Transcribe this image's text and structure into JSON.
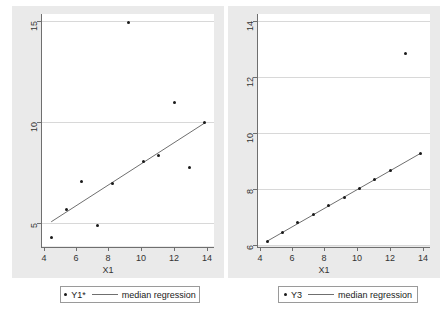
{
  "figure": {
    "background_color": "#ffffff",
    "panel_background": "#eaeaea",
    "plot_background": "#ffffff",
    "grid_color": "#d8d8d8",
    "axis_color": "#6f6f6f",
    "marker_color": "#1a1a1a",
    "line_color": "#6f6f6f"
  },
  "chart_data": [
    {
      "type": "scatter",
      "panel": "left",
      "title": "",
      "xlabel": "X1",
      "ylabel": "",
      "xlim": [
        3.4,
        14.6
      ],
      "ylim": [
        3.9,
        15.4
      ],
      "xticks": [
        4,
        6,
        8,
        10,
        12,
        14
      ],
      "yticks": [
        5,
        10,
        15
      ],
      "grid": true,
      "legend_position": "below",
      "series": [
        {
          "name": "Y1*",
          "type": "scatter",
          "x": [
            4,
            5,
            6,
            7,
            8,
            9,
            10,
            11,
            12,
            13,
            14
          ],
          "y": [
            4.3,
            5.7,
            7.1,
            4.9,
            7.0,
            15.0,
            8.1,
            8.4,
            11.0,
            7.8,
            10.0
          ]
        },
        {
          "name": "median regression",
          "type": "line",
          "x": [
            4,
            14
          ],
          "y": [
            5.1,
            10.0
          ]
        }
      ]
    },
    {
      "type": "scatter",
      "panel": "right",
      "title": "",
      "xlabel": "X1",
      "ylabel": "",
      "xlim": [
        3.4,
        14.6
      ],
      "ylim": [
        5.2,
        14.3
      ],
      "xticks": [
        4,
        6,
        8,
        10,
        12,
        14
      ],
      "yticks": [
        6,
        8,
        10,
        12,
        14
      ],
      "grid": true,
      "legend_position": "below",
      "series": [
        {
          "name": "Y3",
          "type": "scatter",
          "x": [
            4,
            5,
            6,
            7,
            8,
            9,
            10,
            11,
            12,
            13,
            14
          ],
          "y": [
            5.39,
            5.73,
            6.11,
            6.42,
            6.77,
            7.11,
            7.46,
            7.81,
            8.15,
            12.74,
            8.84
          ]
        },
        {
          "name": "median regression",
          "type": "line",
          "x": [
            4,
            14
          ],
          "y": [
            5.39,
            8.84
          ]
        }
      ]
    }
  ],
  "left_panel": {
    "xaxis_title": "X1",
    "xticklabels": [
      "4",
      "6",
      "8",
      "10",
      "12",
      "14"
    ],
    "yticklabels": [
      "5",
      "10",
      "15"
    ],
    "legend": {
      "marker_label": "Y1*",
      "line_label": "median regression"
    }
  },
  "right_panel": {
    "xaxis_title": "X1",
    "xticklabels": [
      "4",
      "6",
      "8",
      "10",
      "12",
      "14"
    ],
    "yticklabels": [
      "6",
      "8",
      "10",
      "12",
      "14"
    ],
    "legend": {
      "marker_label": "Y3",
      "line_label": "median regression"
    }
  }
}
